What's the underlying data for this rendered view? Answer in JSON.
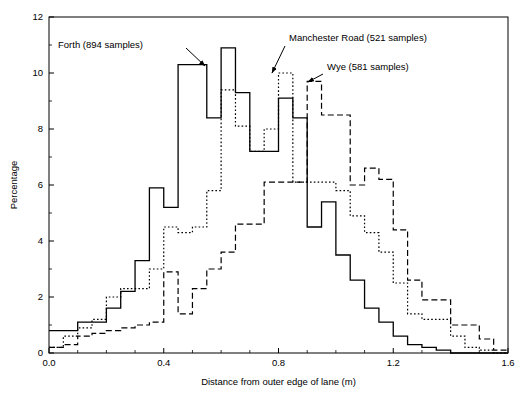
{
  "chart_data": {
    "type": "line",
    "title": "",
    "subtitle": "",
    "xlabel": "Distance from outer edge of lane (m)",
    "ylabel": "Percentage",
    "xlim": [
      0.0,
      1.6
    ],
    "ylim": [
      0,
      12
    ],
    "xticks": [
      "0.0",
      "0.4",
      "0.8",
      "1.2",
      "1.6"
    ],
    "xtick_values": [
      0.0,
      0.4,
      0.8,
      1.2,
      1.6
    ],
    "xminor_step": 0.1,
    "yticks": [
      "0",
      "2",
      "4",
      "6",
      "8",
      "10",
      "12"
    ],
    "ytick_values": [
      0,
      2,
      4,
      6,
      8,
      10,
      12
    ],
    "grid": false,
    "legend_position": "inline-annotations",
    "style": "step-histogram",
    "bin_width": 0.05,
    "series": [
      {
        "name": "Forth (894 samples)",
        "samples": 894,
        "line_style": "solid",
        "x_bin_starts": [
          0.0,
          0.05,
          0.1,
          0.15,
          0.2,
          0.25,
          0.3,
          0.35,
          0.4,
          0.45,
          0.5,
          0.55,
          0.6,
          0.65,
          0.7,
          0.75,
          0.8,
          0.85,
          0.9,
          0.95,
          1.0,
          1.05,
          1.1,
          1.15,
          1.2,
          1.25,
          1.3,
          1.35,
          1.4,
          1.45,
          1.5,
          1.55
        ],
        "values": [
          0.8,
          0.8,
          1.1,
          1.1,
          1.6,
          2.2,
          3.3,
          5.9,
          5.2,
          10.3,
          10.3,
          8.4,
          10.9,
          9.3,
          7.2,
          7.2,
          9.1,
          8.4,
          4.5,
          5.4,
          3.5,
          2.6,
          1.6,
          1.1,
          0.6,
          0.3,
          0.2,
          0.1,
          0.0,
          0.0,
          0.0,
          0.0
        ]
      },
      {
        "name": "Manchester Road (521 samples)",
        "samples": 521,
        "line_style": "dotted",
        "x_bin_starts": [
          0.0,
          0.05,
          0.1,
          0.15,
          0.2,
          0.25,
          0.3,
          0.35,
          0.4,
          0.45,
          0.5,
          0.55,
          0.6,
          0.65,
          0.7,
          0.75,
          0.8,
          0.85,
          0.9,
          0.95,
          1.0,
          1.05,
          1.1,
          1.15,
          1.2,
          1.25,
          1.3,
          1.35,
          1.4,
          1.45,
          1.5,
          1.55
        ],
        "values": [
          0.2,
          0.6,
          0.9,
          1.2,
          2.0,
          2.3,
          2.3,
          3.0,
          4.5,
          4.3,
          4.5,
          5.8,
          9.4,
          8.1,
          7.2,
          8.0,
          10.0,
          6.1,
          6.1,
          6.1,
          5.8,
          4.9,
          4.3,
          3.6,
          2.5,
          1.4,
          1.2,
          1.2,
          0.6,
          0.2,
          0.1,
          0.0
        ]
      },
      {
        "name": "Wye (581 samples)",
        "samples": 581,
        "line_style": "dashed",
        "x_bin_starts": [
          0.0,
          0.05,
          0.1,
          0.15,
          0.2,
          0.25,
          0.3,
          0.35,
          0.4,
          0.45,
          0.5,
          0.55,
          0.6,
          0.65,
          0.7,
          0.75,
          0.8,
          0.85,
          0.9,
          0.95,
          1.0,
          1.05,
          1.1,
          1.15,
          1.2,
          1.25,
          1.3,
          1.35,
          1.4,
          1.45,
          1.5,
          1.55
        ],
        "values": [
          0.2,
          0.3,
          0.6,
          0.7,
          0.8,
          0.9,
          1.0,
          1.1,
          2.9,
          1.4,
          2.3,
          3.0,
          3.6,
          4.6,
          4.6,
          6.1,
          6.1,
          6.1,
          9.7,
          8.5,
          8.5,
          6.0,
          6.6,
          6.2,
          4.4,
          2.6,
          1.9,
          1.9,
          1.0,
          1.0,
          0.5,
          0.1
        ]
      }
    ],
    "annotations": [
      {
        "text": "Forth (894 samples)",
        "target_x": 0.47,
        "target_y": 10.3
      },
      {
        "text": "Manchester Road (521 samples)",
        "target_x": 0.8,
        "target_y": 10.0
      },
      {
        "text": "Wye (581 samples)",
        "target_x": 0.92,
        "target_y": 9.7
      }
    ]
  },
  "axes": {
    "xlabel": "Distance from outer edge of lane (m)",
    "ylabel": "Percentage"
  },
  "colors": {
    "foreground": "#000000",
    "background": "#ffffff"
  }
}
